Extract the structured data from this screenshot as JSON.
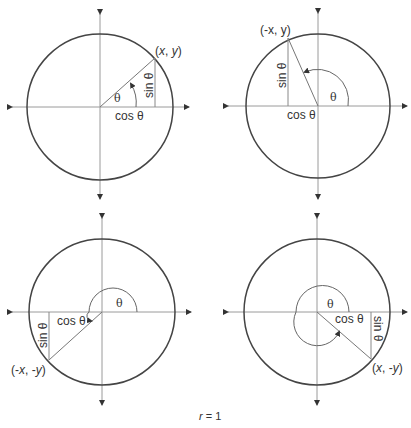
{
  "caption": {
    "var": "r",
    "rest": " = 1"
  },
  "labels": {
    "theta": "θ",
    "cos": "cos θ",
    "sin": "sin θ"
  },
  "panels": [
    {
      "name": "quadrant-1",
      "point_label_parts": [
        "(",
        "x",
        ", ",
        "y",
        ")"
      ],
      "point": "(x, y)"
    },
    {
      "name": "quadrant-2",
      "point": "(-x, y)"
    },
    {
      "name": "quadrant-3",
      "point_label_parts": [
        "(-",
        "x",
        ", -",
        "y",
        ")"
      ],
      "point": "(-x, -y)"
    },
    {
      "name": "quadrant-4",
      "point_label_parts": [
        "(",
        "x",
        ", -",
        "y",
        ")"
      ],
      "point": "(x, -y)"
    }
  ],
  "colors": {
    "circle": "#444444",
    "axis": "#9a9a9a",
    "text": "#333333"
  }
}
